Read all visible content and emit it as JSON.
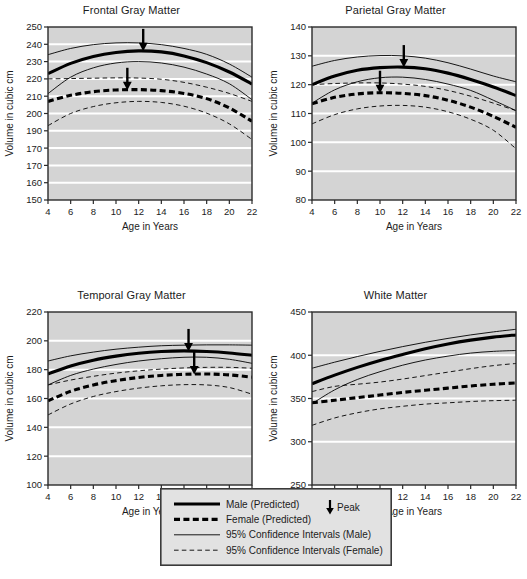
{
  "figure": {
    "background": "#ffffff",
    "plot_background": "#d4d4d4",
    "gridline_color": "#ffffff",
    "line_color": "#000000",
    "panel_count": 4
  },
  "chart_data": [
    {
      "type": "line",
      "title": "Frontal Gray Matter",
      "xlabel": "Age in Years",
      "ylabel": "Volume in cubic cm",
      "xlim": [
        4,
        22
      ],
      "ylim": [
        150,
        250
      ],
      "xticks": [
        4,
        6,
        8,
        10,
        12,
        14,
        16,
        18,
        20,
        22
      ],
      "yticks": [
        150,
        160,
        170,
        170,
        190,
        200,
        210,
        220,
        230,
        240,
        250
      ],
      "ytick_values": [
        150,
        160,
        170,
        180,
        190,
        200,
        210,
        220,
        230,
        240,
        250
      ],
      "grid": "horizontal",
      "x": [
        4,
        6,
        8,
        10,
        12,
        14,
        16,
        18,
        20,
        22
      ],
      "series": [
        {
          "name": "Male (Predicted)",
          "style": "solid-thick",
          "values": [
            223.0,
            229.0,
            233.0,
            235.3,
            236.2,
            235.6,
            233.3,
            229.4,
            224.0,
            217.0
          ]
        },
        {
          "name": "Female (Predicted)",
          "style": "dashed-thick",
          "values": [
            207.0,
            210.5,
            212.6,
            213.6,
            213.8,
            213.2,
            211.6,
            208.6,
            203.2,
            195.5
          ]
        },
        {
          "name": "95% Confidence Intervals (Male) upper",
          "style": "solid-thin",
          "values": [
            234.0,
            237.6,
            239.8,
            240.8,
            240.8,
            239.8,
            237.6,
            234.2,
            228.6,
            221.0
          ]
        },
        {
          "name": "95% Confidence Intervals (Male) lower",
          "style": "solid-thin",
          "values": [
            211.5,
            221.0,
            226.4,
            229.2,
            230.0,
            229.2,
            226.8,
            222.8,
            217.2,
            208.0
          ]
        },
        {
          "name": "95% Confidence Intervals (Female) upper",
          "style": "dashed-thin",
          "values": [
            220.0,
            220.2,
            220.4,
            220.6,
            220.5,
            219.8,
            218.0,
            215.2,
            211.6,
            207.0
          ]
        },
        {
          "name": "95% Confidence Intervals (Female) lower",
          "style": "dashed-thin",
          "values": [
            193.0,
            200.0,
            204.0,
            206.2,
            207.0,
            206.4,
            204.2,
            200.2,
            194.0,
            185.0
          ]
        }
      ],
      "annotations": [
        {
          "label": "Peak",
          "series": "Male (Predicted)",
          "x": 12.4,
          "y": 236.2
        },
        {
          "label": "Peak",
          "series": "Female (Predicted)",
          "x": 11.0,
          "y": 213.7
        }
      ]
    },
    {
      "type": "line",
      "title": "Parietal Gray Matter",
      "xlabel": "Age in Years",
      "ylabel": "Volume in cubic cm",
      "xlim": [
        4,
        22
      ],
      "ylim": [
        80,
        140
      ],
      "xticks": [
        4,
        6,
        8,
        10,
        12,
        14,
        16,
        18,
        20,
        22
      ],
      "yticks": [
        80,
        90,
        100,
        110,
        120,
        130,
        140
      ],
      "ytick_values": [
        80,
        90,
        100,
        110,
        120,
        130,
        140
      ],
      "grid": "horizontal",
      "x": [
        4,
        6,
        8,
        10,
        12,
        14,
        16,
        18,
        20,
        22
      ],
      "series": [
        {
          "name": "Male (Predicted)",
          "style": "solid-thick",
          "values": [
            120.0,
            123.0,
            125.0,
            125.9,
            126.1,
            125.5,
            124.0,
            121.8,
            119.2,
            116.2
          ]
        },
        {
          "name": "Female (Predicted)",
          "style": "dashed-thick",
          "values": [
            113.4,
            115.6,
            116.8,
            117.2,
            117.0,
            116.2,
            114.6,
            112.2,
            109.0,
            105.2
          ]
        },
        {
          "name": "95% Confidence Intervals (Male) upper",
          "style": "solid-thin",
          "values": [
            126.4,
            128.4,
            129.6,
            130.1,
            130.0,
            129.2,
            127.6,
            125.4,
            123.0,
            121.0
          ]
        },
        {
          "name": "95% Confidence Intervals (Male) lower",
          "style": "solid-thin",
          "values": [
            113.6,
            118.2,
            121.0,
            122.4,
            122.6,
            121.8,
            120.2,
            118.0,
            114.6,
            111.0
          ]
        },
        {
          "name": "95% Confidence Intervals (Female) upper",
          "style": "dashed-thin",
          "values": [
            120.0,
            120.4,
            120.6,
            120.6,
            120.2,
            119.4,
            118.0,
            116.0,
            113.6,
            111.0
          ]
        },
        {
          "name": "95% Confidence Intervals (Female) lower",
          "style": "dashed-thin",
          "values": [
            106.4,
            109.6,
            111.6,
            112.6,
            112.8,
            112.2,
            110.6,
            108.0,
            104.2,
            97.8
          ]
        }
      ],
      "annotations": [
        {
          "label": "Peak",
          "series": "Male (Predicted)",
          "x": 12.1,
          "y": 126.1
        },
        {
          "label": "Peak",
          "series": "Female (Predicted)",
          "x": 10.0,
          "y": 117.2
        }
      ]
    },
    {
      "type": "line",
      "title": "Temporal Gray Matter",
      "xlabel": "Age in Years",
      "ylabel": "Volume in cubic cm",
      "xlim": [
        4,
        22
      ],
      "ylim": [
        100,
        220
      ],
      "xticks": [
        4,
        6,
        8,
        10,
        12,
        14,
        16,
        18,
        20,
        22
      ],
      "yticks": [
        100,
        120,
        140,
        160,
        180,
        200,
        220
      ],
      "ytick_values": [
        100,
        120,
        140,
        160,
        180,
        200,
        220
      ],
      "grid": "horizontal",
      "x": [
        4,
        6,
        8,
        10,
        12,
        14,
        16,
        18,
        20,
        22
      ],
      "series": [
        {
          "name": "Male (Predicted)",
          "style": "solid-thick",
          "values": [
            177.0,
            182.6,
            186.6,
            189.4,
            191.4,
            192.6,
            193.0,
            192.6,
            191.6,
            190.0
          ]
        },
        {
          "name": "Female (Predicted)",
          "style": "dashed-thick",
          "values": [
            158.4,
            165.0,
            169.4,
            172.4,
            174.6,
            176.0,
            176.8,
            177.0,
            176.4,
            174.8
          ]
        },
        {
          "name": "95% Confidence Intervals (Male) upper",
          "style": "solid-thin",
          "values": [
            186.0,
            189.6,
            192.2,
            194.2,
            195.6,
            196.6,
            197.0,
            197.2,
            197.2,
            197.0
          ]
        },
        {
          "name": "95% Confidence Intervals (Male) lower",
          "style": "solid-thin",
          "values": [
            169.4,
            176.0,
            180.4,
            183.6,
            186.0,
            187.6,
            188.6,
            188.6,
            187.2,
            184.4
          ]
        },
        {
          "name": "95% Confidence Intervals (Female) upper",
          "style": "dashed-thin",
          "values": [
            169.4,
            172.8,
            175.4,
            177.6,
            179.2,
            180.4,
            181.2,
            181.6,
            181.6,
            181.0
          ]
        },
        {
          "name": "95% Confidence Intervals (Female) lower",
          "style": "dashed-thin",
          "values": [
            148.6,
            156.2,
            161.4,
            164.8,
            167.2,
            168.8,
            169.6,
            169.4,
            167.6,
            163.0
          ]
        }
      ],
      "annotations": [
        {
          "label": "Peak",
          "series": "Male (Predicted)",
          "x": 16.4,
          "y": 193.0
        },
        {
          "label": "Peak",
          "series": "Female (Predicted)",
          "x": 16.9,
          "y": 177.0
        }
      ]
    },
    {
      "type": "line",
      "title": "White Matter",
      "xlabel": "Age in Years",
      "ylabel": "Volume in cubic cm",
      "xlim": [
        4,
        22
      ],
      "ylim": [
        250,
        450
      ],
      "xticks": [
        4,
        6,
        8,
        10,
        12,
        14,
        16,
        18,
        20,
        22
      ],
      "yticks": [
        250,
        300,
        350,
        400,
        450
      ],
      "ytick_values": [
        250,
        300,
        350,
        400,
        450
      ],
      "grid": "horizontal",
      "x": [
        4,
        6,
        8,
        10,
        12,
        14,
        16,
        18,
        20,
        22
      ],
      "series": [
        {
          "name": "Male (Predicted)",
          "style": "solid-thick",
          "values": [
            367.0,
            377.0,
            386.0,
            394.0,
            401.0,
            407.5,
            413.0,
            417.5,
            421.0,
            423.5
          ]
        },
        {
          "name": "Female (Predicted)",
          "style": "dashed-thick",
          "values": [
            345.0,
            348.0,
            351.0,
            354.0,
            357.0,
            359.5,
            362.0,
            364.5,
            366.5,
            368.0
          ]
        },
        {
          "name": "95% Confidence Intervals (Male) upper",
          "style": "solid-thin",
          "values": [
            385.0,
            392.0,
            398.5,
            404.5,
            410.0,
            415.0,
            419.5,
            423.5,
            427.0,
            430.0
          ]
        },
        {
          "name": "95% Confidence Intervals (Male) lower",
          "style": "solid-thin",
          "values": [
            344.0,
            360.0,
            372.0,
            381.0,
            388.5,
            394.5,
            399.0,
            402.5,
            404.5,
            405.5
          ]
        },
        {
          "name": "95% Confidence Intervals (Female) upper",
          "style": "dashed-thin",
          "values": [
            358.0,
            364.0,
            366.5,
            369.0,
            372.5,
            376.5,
            380.5,
            384.5,
            388.0,
            390.5
          ]
        },
        {
          "name": "95% Confidence Intervals (Female) lower",
          "style": "dashed-thin",
          "values": [
            319.0,
            327.5,
            333.5,
            338.0,
            341.0,
            343.5,
            345.0,
            346.5,
            347.5,
            348.0
          ]
        }
      ],
      "annotations": []
    }
  ],
  "legend": {
    "entries": [
      {
        "label": "Male (Predicted)",
        "style": "solid-thick"
      },
      {
        "label": "Female (Predicted)",
        "style": "dashed-thick"
      },
      {
        "label": "95% Confidence Intervals (Male)",
        "style": "solid-thin"
      },
      {
        "label": "95% Confidence Intervals (Female)",
        "style": "dashed-thin"
      }
    ],
    "peak_label": "Peak"
  }
}
